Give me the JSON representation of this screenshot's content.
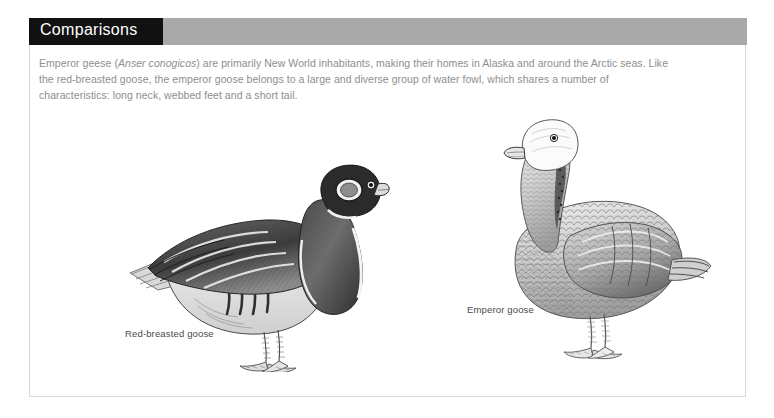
{
  "page": {
    "background_color": "#ffffff"
  },
  "card": {
    "border_color": "#d8d8d8",
    "background_color": "#ffffff"
  },
  "header": {
    "title": "Comparisons",
    "tab_color": "#111111",
    "band_color": "#a9a9a9",
    "title_color": "#ffffff"
  },
  "body": {
    "text_color": "#8e8e8e",
    "paragraph": {
      "part1": "Emperor geese (",
      "species": "Anser conogicos",
      "part2": ") are primarily New World inhabitants, making their homes in Alaska and around the Arctic seas. Like the red-breasted goose, the emperor goose belongs to a large and diverse group of water fowl, which shares a number of characteristics: long neck, webbed feet and a short tail."
    }
  },
  "figures": [
    {
      "id": "red-breasted-goose",
      "caption": "Red-breasted goose",
      "description": "pen-and-ink engraving of a red-breasted goose standing in profile facing right, dark head with white cheek patch, dark barred wing, pale flank stripe and webbed feet"
    },
    {
      "id": "emperor-goose",
      "caption": "Emperor goose",
      "description": "pen-and-ink engraving of an emperor goose standing in profile facing left, white head, scalloped grey barred body plumage and webbed feet"
    }
  ],
  "caption_color": "#4a4a4a"
}
